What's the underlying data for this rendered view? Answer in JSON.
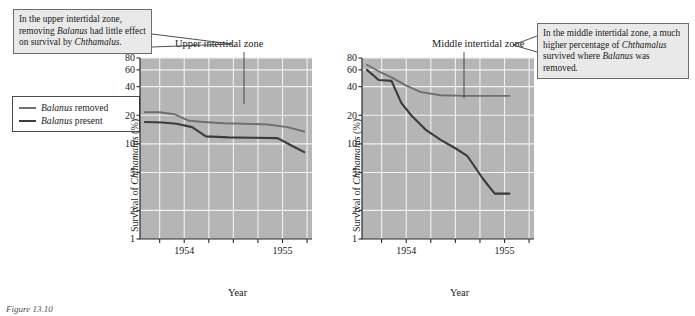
{
  "callouts": {
    "left": {
      "name": "upper-zone-annotation",
      "line1": "In the upper intertidal",
      "line2_a": "zone, removing ",
      "line2_sp": "Balanus",
      "line3": "had little effect on",
      "line4_a": "survival by ",
      "line4_sp": "Chthamalus."
    },
    "right": {
      "name": "middle-zone-annotation",
      "line1": "In the middle intertidal zone,",
      "line2": "a much higher percentage of",
      "line3_sp": "Chthamalus",
      "line3_b": " survived where",
      "line4_sp": "Balanus",
      "line4_b": " was removed."
    }
  },
  "legend": {
    "items": [
      {
        "label_sp": "Balanus",
        "label_rest": " removed",
        "color": "#6f6f6f"
      },
      {
        "label_sp": "Balanus",
        "label_rest": " present",
        "color": "#3b3b3b"
      }
    ]
  },
  "axis": {
    "ylabel_prefix": "Survival of ",
    "ylabel_species": "Chthamalus",
    "ylabel_suffix": " (%)",
    "xlabel": "Year"
  },
  "caption": "Figure 13.10",
  "colors": {
    "plot_background": "#b5b5b5",
    "gridline": "#f2f2f2",
    "axis": "#2b2b2b",
    "series_removed": "#6f6f6f",
    "series_present": "#3b3b3b",
    "callout_background": "#e9e9e9",
    "callout_border": "#6d6d6d"
  },
  "chart_data": [
    {
      "type": "line",
      "title": "Upper intertidal zone",
      "xlabel": "Year",
      "ylabel": "Survival of Chthamalus (%)",
      "yscale": "log",
      "ylim": [
        1,
        80
      ],
      "yticks": [
        1,
        2,
        5,
        10,
        20,
        40,
        60,
        80
      ],
      "ytick_labels": [
        "1",
        "2",
        "5",
        "10",
        "20",
        "40",
        "60",
        "80"
      ],
      "xlim": [
        1953.55,
        1955.3
      ],
      "xticks": [
        1953.75,
        1954.0,
        1954.25,
        1954.5,
        1954.75,
        1955.0,
        1955.25
      ],
      "xtick_labels": [
        "",
        "1954",
        "",
        "",
        "",
        "1955",
        ""
      ],
      "grid": true,
      "legend": "external-left",
      "series": [
        {
          "name": "Balanus removed",
          "color": "#6f6f6f",
          "x": [
            1953.6,
            1953.75,
            1953.9,
            1954.05,
            1954.2,
            1954.4,
            1954.6,
            1954.85,
            1955.05,
            1955.22
          ],
          "values": [
            21.5,
            21.5,
            20.5,
            17.5,
            17.0,
            16.5,
            16.3,
            16.0,
            15.0,
            13.5
          ]
        },
        {
          "name": "Balanus present",
          "color": "#3b3b3b",
          "x": [
            1953.6,
            1953.78,
            1953.92,
            1954.08,
            1954.22,
            1954.45,
            1954.7,
            1954.95,
            1955.1,
            1955.22
          ],
          "values": [
            17.0,
            16.8,
            16.3,
            15.0,
            12.0,
            11.7,
            11.6,
            11.5,
            9.5,
            8.2
          ]
        }
      ]
    },
    {
      "type": "line",
      "title": "Middle intertidal zone",
      "xlabel": "Year",
      "ylabel": "Survival of Chthamalus (%)",
      "yscale": "log",
      "ylim": [
        1,
        80
      ],
      "yticks": [
        1,
        2,
        5,
        10,
        20,
        40,
        60,
        80
      ],
      "ytick_labels": [
        "1",
        "2",
        "5",
        "10",
        "20",
        "40",
        "60",
        "80"
      ],
      "xlim": [
        1953.55,
        1955.3
      ],
      "xticks": [
        1953.75,
        1954.0,
        1954.25,
        1954.5,
        1954.75,
        1955.0,
        1955.25
      ],
      "xtick_labels": [
        "",
        "1954",
        "",
        "",
        "",
        "1955",
        ""
      ],
      "grid": true,
      "legend": "external-left",
      "series": [
        {
          "name": "Balanus removed",
          "color": "#6f6f6f",
          "x": [
            1953.6,
            1953.72,
            1953.85,
            1954.0,
            1954.15,
            1954.35,
            1954.6,
            1954.9,
            1955.05
          ],
          "values": [
            68.0,
            58.0,
            50.0,
            41.0,
            35.0,
            32.5,
            32.0,
            32.0,
            32.0
          ]
        },
        {
          "name": "Balanus present",
          "color": "#3b3b3b",
          "x": [
            1953.6,
            1953.72,
            1953.85,
            1953.95,
            1954.05,
            1954.2,
            1954.35,
            1954.5,
            1954.62,
            1954.78,
            1954.9,
            1955.05
          ],
          "values": [
            60.0,
            47.0,
            46.0,
            27.0,
            20.0,
            14.0,
            11.0,
            9.0,
            7.5,
            4.3,
            3.0,
            3.0
          ]
        }
      ]
    }
  ]
}
